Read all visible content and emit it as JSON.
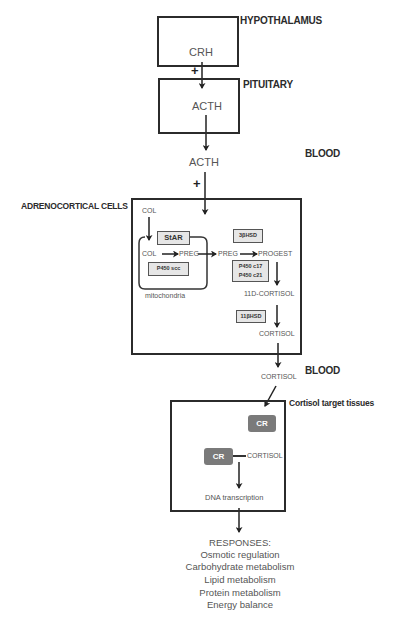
{
  "regions": {
    "hypothalamus": "HYPOTHALAMUS",
    "pituitary": "PITUITARY",
    "blood_1": "BLOOD",
    "adrenocortical": "ADRENOCORTICAL CELLS",
    "blood_2": "BLOOD",
    "target_tissues": "Cortisol  target tissues"
  },
  "hormones": {
    "crh": "CRH",
    "acth_pituitary": "ACTH",
    "acth_blood": "ACTH",
    "cortisol_cell": "CORTISOL",
    "cortisol_blood": "CORTISOL",
    "cortisol_target": "CORTISOL"
  },
  "stimulation_marks": {
    "crh_to_acth": "+",
    "acth_to_adrenal": "+"
  },
  "adrenal_pathway": {
    "col_outside": "COL",
    "col_inside": "COL",
    "preg_mito": "PREG",
    "preg_cyto": "PREG",
    "progest": "PROGEST",
    "deoxycortisol": "11D-CORTISOL",
    "mitochondria_label": "mitochondria",
    "enzymes": {
      "star": "StAR",
      "p450scc": "P450 scc",
      "hsd3b": "3βHSD",
      "p450c17": "P450 c17",
      "p450c21": "P450 c21",
      "hsd11b": "11βHSD"
    }
  },
  "target": {
    "receptor_free": "CR",
    "receptor_bound": "CR",
    "dna_transcription": "DNA  transcription"
  },
  "responses": {
    "header": "RESPONSES:",
    "items": [
      "Osmotic regulation",
      "Carbohydrate metabolism",
      "Lipid metabolism",
      "Protein metabolism",
      "Energy balance"
    ]
  }
}
